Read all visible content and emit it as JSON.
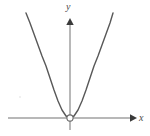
{
  "figure": {
    "background_color": "#ffffff",
    "width": 150,
    "height": 136
  },
  "labels": {
    "y_axis": "y",
    "x_axis": "x"
  },
  "colors": {
    "axis": "#b8b8b8",
    "arrowhead": "#3a3a3a",
    "curve": "#585858",
    "label_text": "#4a4a4a",
    "vertex_marker_fill": "#ffffff",
    "vertex_marker_stroke": "#6b6b6b"
  },
  "chart_data": {
    "type": "line",
    "title": "",
    "subtitle": "",
    "xlabel": "x",
    "ylabel": "y",
    "grid": false,
    "legend": null,
    "legend_position": "none",
    "origin_px": {
      "x": 70,
      "y": 118
    },
    "axes": {
      "x_axis": {
        "orientation": "horizontal",
        "y_px": 118,
        "start_px": 8,
        "end_px": 136,
        "arrow": "right",
        "label": "x",
        "ticks": [],
        "tick_labels": []
      },
      "y_axis": {
        "orientation": "vertical",
        "x_px": 70,
        "start_px": 130,
        "end_px": 18,
        "arrow": "up",
        "label": "y",
        "ticks": [],
        "tick_labels": []
      }
    },
    "series": [
      {
        "name": "parabola",
        "equation": "y = a x^2, a > 0",
        "vertex": [
          0,
          0
        ],
        "opens": "up",
        "color": "#585858",
        "points_px": [
          [
            26,
            13
          ],
          [
            30,
            23
          ],
          [
            34,
            34
          ],
          [
            38,
            45
          ],
          [
            42,
            56
          ],
          [
            46,
            66
          ],
          [
            50,
            78
          ],
          [
            54,
            90
          ],
          [
            58,
            101
          ],
          [
            62,
            110
          ],
          [
            66,
            116
          ],
          [
            70,
            118
          ],
          [
            74,
            116
          ],
          [
            78,
            110
          ],
          [
            82,
            101
          ],
          [
            86,
            90
          ],
          [
            90,
            78
          ],
          [
            94,
            66
          ],
          [
            98,
            56
          ],
          [
            102,
            45
          ],
          [
            106,
            34
          ],
          [
            110,
            23
          ],
          [
            113,
            13
          ]
        ],
        "points_data": [
          [
            -44,
            105
          ],
          [
            -40,
            95
          ],
          [
            -36,
            84
          ],
          [
            -32,
            73
          ],
          [
            -28,
            62
          ],
          [
            -24,
            52
          ],
          [
            -20,
            40
          ],
          [
            -16,
            28
          ],
          [
            -12,
            17
          ],
          [
            -8,
            8
          ],
          [
            -4,
            2
          ],
          [
            0,
            0
          ],
          [
            4,
            2
          ],
          [
            8,
            8
          ],
          [
            12,
            17
          ],
          [
            16,
            28
          ],
          [
            20,
            40
          ],
          [
            24,
            52
          ],
          [
            28,
            62
          ],
          [
            32,
            73
          ],
          [
            36,
            84
          ],
          [
            40,
            95
          ],
          [
            43,
            105
          ]
        ]
      }
    ],
    "annotations": [
      {
        "name": "vertex-open-circle",
        "kind": "open-circle-marker",
        "at_px": [
          70,
          118
        ],
        "at_data": [
          0,
          0
        ],
        "label": "",
        "meaning": "open point (excluded) at the vertex / origin"
      }
    ],
    "xlim_px": [
      8,
      136
    ],
    "ylim_px": [
      130,
      13
    ]
  }
}
